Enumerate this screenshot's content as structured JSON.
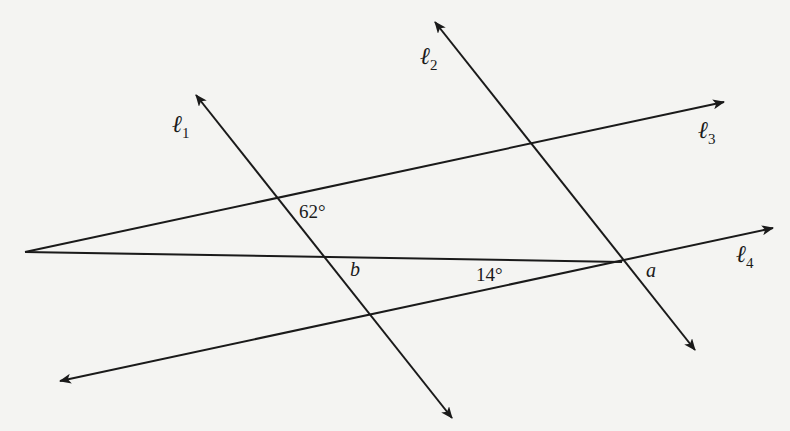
{
  "diagram": {
    "type": "geometry-lines-angles",
    "lines": [
      {
        "id": "l1",
        "label": "ℓ",
        "sub": "1",
        "from": [
          452,
          418
        ],
        "to": [
          196,
          95
        ],
        "arrows": "both"
      },
      {
        "id": "l2",
        "label": "ℓ",
        "sub": "2",
        "from": [
          695,
          350
        ],
        "to": [
          435,
          22
        ],
        "arrows": "both"
      },
      {
        "id": "l3",
        "label": "ℓ",
        "sub": "3",
        "from": [
          25,
          252
        ],
        "to": [
          724,
          102
        ],
        "arrows": "end"
      },
      {
        "id": "l4",
        "label": "ℓ",
        "sub": "4",
        "from": [
          60,
          381
        ],
        "to": [
          773,
          228
        ],
        "arrows": "both"
      },
      {
        "id": "transversal",
        "label": "",
        "from": [
          25,
          252
        ],
        "to": [
          622,
          262
        ],
        "arrows": "none"
      }
    ],
    "labels": {
      "l1": {
        "main": "ℓ",
        "sub": "1"
      },
      "l2": {
        "main": "ℓ",
        "sub": "2"
      },
      "l3": {
        "main": "ℓ",
        "sub": "3"
      },
      "l4": {
        "main": "ℓ",
        "sub": "4"
      },
      "angle_62": "62°",
      "angle_14": "14°",
      "angle_a": "a",
      "angle_b": "b"
    },
    "colors": {
      "line": "#1a1a1a",
      "background": "#f4f4f2"
    }
  }
}
